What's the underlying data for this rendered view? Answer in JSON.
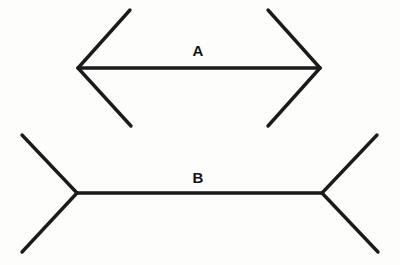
{
  "figure": {
    "background_color": "#fdfdfc",
    "stroke_color": "#1b1b1b",
    "stroke_width": 3.4,
    "canvas": {
      "width": 400,
      "height": 265
    }
  },
  "chart_data": {
    "type": "diagram",
    "xlabel": "",
    "ylabel": "",
    "xlim": [
      0,
      400
    ],
    "ylim": [
      0,
      265
    ],
    "grid": false,
    "legend": null,
    "annotations": [
      {
        "text": "A",
        "x": 198,
        "y": 50
      },
      {
        "text": "B",
        "x": 198,
        "y": 177
      }
    ],
    "series": [
      {
        "name": "A",
        "label": "A",
        "label_x": 198,
        "label_y": 50,
        "fin_direction": "inward",
        "shaft": {
          "x1": 78,
          "y1": 68,
          "x2": 320,
          "y2": 68
        },
        "shaft_length_px": 242,
        "fins": [
          {
            "name": "A-top-left-fin",
            "x1": 78,
            "y1": 68,
            "x2": 130,
            "y2": 10
          },
          {
            "name": "A-bottom-left-fin",
            "x1": 78,
            "y1": 68,
            "x2": 131,
            "y2": 126
          },
          {
            "name": "A-top-right-fin",
            "x1": 320,
            "y1": 68,
            "x2": 268,
            "y2": 10
          },
          {
            "name": "A-bottom-right-fin",
            "x1": 320,
            "y1": 68,
            "x2": 268,
            "y2": 126
          }
        ]
      },
      {
        "name": "B",
        "label": "B",
        "label_x": 198,
        "label_y": 177,
        "fin_direction": "outward",
        "shaft": {
          "x1": 77,
          "y1": 193,
          "x2": 322,
          "y2": 193
        },
        "shaft_length_px": 245,
        "fins": [
          {
            "name": "B-top-left-fin",
            "x1": 77,
            "y1": 193,
            "x2": 22,
            "y2": 135
          },
          {
            "name": "B-bottom-left-fin",
            "x1": 77,
            "y1": 193,
            "x2": 22,
            "y2": 252
          },
          {
            "name": "B-top-right-fin",
            "x1": 322,
            "y1": 193,
            "x2": 377,
            "y2": 135
          },
          {
            "name": "B-bottom-right-fin",
            "x1": 322,
            "y1": 193,
            "x2": 378,
            "y2": 252
          }
        ]
      }
    ]
  }
}
